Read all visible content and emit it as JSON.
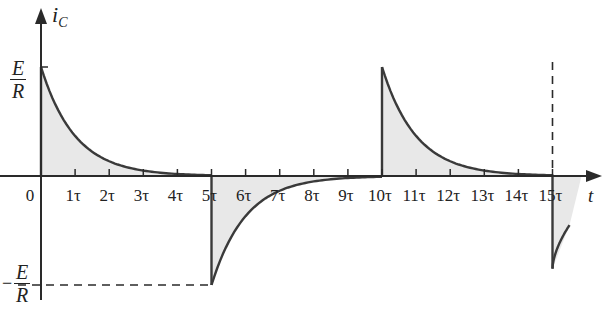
{
  "chart_data": {
    "type": "line",
    "title": "",
    "ylabel": "i_C",
    "xlabel": "t",
    "y_ticks": [
      {
        "label": "E/R",
        "value": 1
      },
      {
        "label": "-E/R",
        "value": -1
      }
    ],
    "x_ticks": [
      "0",
      "1τ",
      "2τ",
      "3τ",
      "4τ",
      "5τ",
      "6τ",
      "7τ",
      "8τ",
      "9τ",
      "10τ",
      "11τ",
      "12τ",
      "13τ",
      "14τ",
      "15τ"
    ],
    "x_range_tau": [
      0,
      16
    ],
    "y_range": [
      -1,
      1
    ],
    "grid": false,
    "legend": null,
    "segments": [
      {
        "t_start": 0,
        "t_end": 5,
        "start_value": 1,
        "end_value": 0,
        "shape": "exp_decay",
        "shaded": true
      },
      {
        "t_start": 5,
        "t_end": 10,
        "start_value": -1,
        "end_value": 0,
        "shape": "exp_decay",
        "shaded": true
      },
      {
        "t_start": 10,
        "t_end": 15,
        "start_value": 1,
        "end_value": 0,
        "shape": "exp_decay",
        "shaded": true
      },
      {
        "t_start": 15,
        "t_end": 15.5,
        "start_value": -0.85,
        "end_value": -0.45,
        "shape": "exp_decay_partial",
        "shaded": true
      }
    ],
    "annotations": [
      {
        "type": "dashed-line",
        "from": "-E/R level",
        "to": "t=5τ",
        "orientation": "horizontal"
      },
      {
        "type": "dashed-line",
        "at": "t=15τ",
        "orientation": "vertical"
      }
    ]
  },
  "labels": {
    "y_axis": "i",
    "y_axis_sub": "C",
    "x_axis": "t",
    "pos_num": "E",
    "pos_den": "R",
    "neg_sign": "−",
    "neg_num": "E",
    "neg_den": "R",
    "origin": "0",
    "ticks": [
      "1τ",
      "2τ",
      "3τ",
      "4τ",
      "5τ",
      "6τ",
      "7τ",
      "8τ",
      "9τ",
      "10τ",
      "11τ",
      "12τ",
      "13τ",
      "14τ",
      "15τ"
    ]
  },
  "colors": {
    "curve": "#3a3a3a",
    "axis": "#2a2a2a",
    "fill": "#e8e8e8"
  }
}
